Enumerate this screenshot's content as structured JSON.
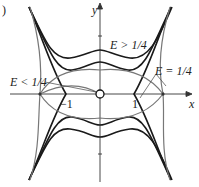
{
  "panel_label": ")",
  "axes": {
    "x_label": "x",
    "y_label": "y"
  },
  "tick_labels": {
    "neg_one": "−1",
    "one": "1"
  },
  "annotations": {
    "e_greater": "E > 1/4",
    "e_less": "E < 1/4",
    "e_equal": "E = 1/4"
  },
  "colors": {
    "trajectory": "#1a1a1a",
    "separatrix_inner": "#777777",
    "axis": "#333333"
  }
}
